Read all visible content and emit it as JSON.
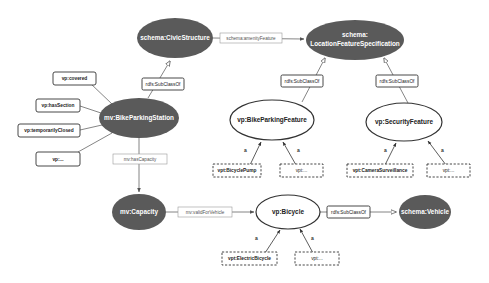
{
  "diagram": {
    "colors": {
      "dark_node_fill": "#5a5a5a",
      "light_node_fill": "#ffffff",
      "stroke": "#333333",
      "edge": "#666666",
      "background": "#ffffff"
    },
    "nodes": {
      "civic_structure": "schema:CivicStructure",
      "location_feature_line1": "schema:",
      "location_feature_line2": "LocationFeatureSpecification",
      "bike_parking_station": "mv:BikeParkingStation",
      "bike_parking_feature": "vp:BikeParkingFeature",
      "security_feature": "vp:SecurityFeature",
      "capacity": "mv:Capacity",
      "bicycle": "vp:Bicycle",
      "vehicle": "schema:Vehicle"
    },
    "property_boxes": {
      "covered": "vp:covered",
      "has_section": "vp:hasSection",
      "temporarily_closed": "vp:temporarilyClosed",
      "vp_more": "vp:..."
    },
    "instance_boxes": {
      "bicycle_pump": "vpt:BicyclePump",
      "bike_feature_more": "vpt:...",
      "camera_surveillance": "vpt:CameraSurveillance",
      "security_more": "vpt:...",
      "electric_bicycle": "vpt:ElectricBicycle",
      "bicycle_more": "vpt:..."
    },
    "edge_labels": {
      "amenity_feature": "schema:amenityFeature",
      "subclass_civic": "rdfs:SubClassOf",
      "subclass_bike_feature": "rdfs:SubClassOf",
      "subclass_security": "rdfs:SubClassOf",
      "has_capacity": "mv:hasCapacity",
      "valid_for_vehicle": "mv:validForVehicle",
      "subclass_vehicle": "rdfs:SubClassOf",
      "a": "a"
    }
  }
}
